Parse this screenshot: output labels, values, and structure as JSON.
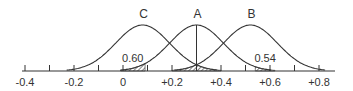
{
  "figure": {
    "type": "overlapping-normal-distributions",
    "axis": {
      "tick_labels": [
        "-0.4",
        "-0.2",
        "0",
        "+0.2",
        "+0.4",
        "+0.6",
        "+0.8"
      ],
      "tick_values": [
        -0.4,
        -0.2,
        0,
        0.2,
        0.4,
        0.6,
        0.8
      ],
      "minor_tick_values": [
        -0.3,
        -0.1,
        0.1,
        0.3,
        0.5,
        0.7
      ],
      "range": [
        -0.42,
        0.86
      ]
    },
    "curves": [
      {
        "label": "C",
        "mean": 0.08
      },
      {
        "label": "A",
        "mean": 0.3
      },
      {
        "label": "B",
        "mean": 0.52
      }
    ],
    "annotations": [
      {
        "text": "0.60",
        "near": 0.04
      },
      {
        "text": "0.54",
        "near": 0.58
      }
    ],
    "shaded_regions": [
      {
        "under": "A left tail",
        "from": -0.01,
        "to": 0.09
      },
      {
        "under": "B and C tails",
        "from": 0.2,
        "to": 0.4
      },
      {
        "under": "A right tail",
        "from": 0.54,
        "to": 0.62
      }
    ],
    "colors": {
      "line": "#333333",
      "background": "#ffffff"
    }
  }
}
